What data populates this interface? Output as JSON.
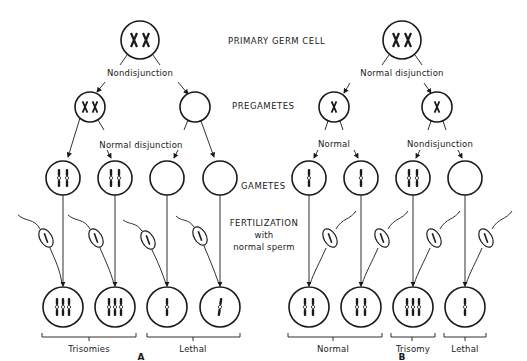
{
  "figure": {
    "stage_labels": {
      "primary": "PRIMARY GERM CELL",
      "pregametes": "PREGAMETES",
      "gametes": "GAMETES",
      "fertilization_1": "FERTILIZATION",
      "fertilization_2": "with",
      "fertilization_3": "normal sperm"
    },
    "panel_a": {
      "label": "A",
      "first_division": "Nondisjunction",
      "second_division": "Normal disjunction",
      "pregametes": [
        "XX",
        "empty"
      ],
      "gametes": [
        "two chromosomes",
        "two chromosomes",
        "empty",
        "empty"
      ],
      "zygotes": [
        "three chromosomes",
        "three chromosomes",
        "one chromosome",
        "one chromosome"
      ],
      "outcomes": [
        "Trisomies",
        "Lethal"
      ]
    },
    "panel_b": {
      "label": "B",
      "first_division": "Normal disjunction",
      "second_division_left": "Normal",
      "second_division_right": "Nondisjunction",
      "pregametes": [
        "X",
        "X"
      ],
      "gametes": [
        "one chromosome",
        "one chromosome",
        "two chromosomes",
        "empty"
      ],
      "zygotes": [
        "two chromosomes",
        "two chromosomes",
        "three chromosomes",
        "one chromosome"
      ],
      "outcomes": [
        "Normal",
        "Trisomy",
        "Lethal"
      ]
    },
    "colors": {
      "ink": "#1a1a1a",
      "background": "#ffffff"
    }
  }
}
